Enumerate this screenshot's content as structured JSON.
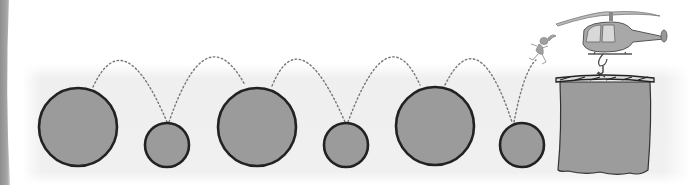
{
  "scene": {
    "description": "Illustration: alternating large and small circles connected by dotted bouncing arcs, a small jumping figure, and a helicopter lowering a bucket",
    "colors": {
      "background": "#ffffff",
      "band": "#eeeeee",
      "left_strip": "#9a9a9a",
      "circle_fill": "#9b9b9b",
      "circle_stroke": "#222222",
      "dots": "#777777",
      "bucket_fill": "#9c9c9c",
      "helicopter_body": "#a8a8a8",
      "helicopter_window": "#d8d8d8"
    },
    "circles": [
      {
        "size": "large",
        "cx": 78,
        "cy": 127,
        "r": 39
      },
      {
        "size": "small",
        "cx": 167,
        "cy": 145,
        "r": 22
      },
      {
        "size": "large",
        "cx": 257,
        "cy": 127,
        "r": 39
      },
      {
        "size": "small",
        "cx": 346,
        "cy": 145,
        "r": 22
      },
      {
        "size": "large",
        "cx": 435,
        "cy": 126,
        "r": 39
      },
      {
        "size": "small",
        "cx": 522,
        "cy": 145,
        "r": 22
      }
    ],
    "arcs_count": 6,
    "figure": "jumping-figure",
    "vehicle": "helicopter",
    "container": "bucket"
  }
}
